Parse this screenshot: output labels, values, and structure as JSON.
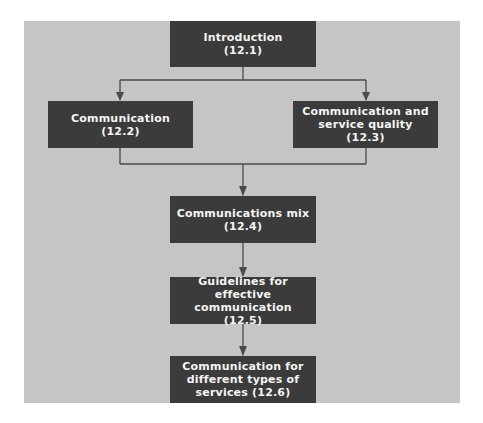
{
  "diagram": {
    "colors": {
      "panel": "#c5c5c5",
      "box": "#3b3b3b",
      "text": "#f4f4f4",
      "line": "#4a4a4a"
    },
    "nodes": [
      {
        "id": "intro",
        "label": "Introduction\n(12.1)"
      },
      {
        "id": "comm",
        "label": "Communication\n(12.2)"
      },
      {
        "id": "quality",
        "label": "Communication and\nservice quality (12.3)"
      },
      {
        "id": "mix",
        "label": "Communications mix\n(12.4)"
      },
      {
        "id": "guidelines",
        "label": "Guidelines for effective\ncommunication (12.5)"
      },
      {
        "id": "types",
        "label": "Communication for\ndifferent types of\nservices (12.6)"
      }
    ],
    "edges": [
      {
        "from": "intro",
        "to": "comm"
      },
      {
        "from": "intro",
        "to": "quality"
      },
      {
        "from": "comm",
        "to": "mix"
      },
      {
        "from": "quality",
        "to": "mix"
      },
      {
        "from": "mix",
        "to": "guidelines"
      },
      {
        "from": "guidelines",
        "to": "types"
      }
    ]
  }
}
